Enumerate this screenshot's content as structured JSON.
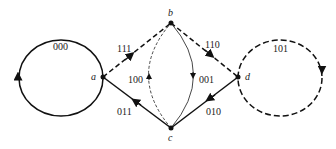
{
  "diagram": {
    "type": "state-transition-graph",
    "nodes": [
      {
        "id": "a",
        "label": "a"
      },
      {
        "id": "b",
        "label": "b"
      },
      {
        "id": "c",
        "label": "c"
      },
      {
        "id": "d",
        "label": "d"
      }
    ],
    "edges": [
      {
        "from": "a",
        "to": "a",
        "label": "000",
        "style": "solid"
      },
      {
        "from": "a",
        "to": "b",
        "label": "111",
        "style": "dashed"
      },
      {
        "from": "c",
        "to": "b",
        "label": "100",
        "style": "dashed"
      },
      {
        "from": "b",
        "to": "c",
        "label": "001",
        "style": "solid"
      },
      {
        "from": "b",
        "to": "d",
        "label": "110",
        "style": "dashed"
      },
      {
        "from": "c",
        "to": "a",
        "label": "011",
        "style": "solid"
      },
      {
        "from": "d",
        "to": "c",
        "label": "010",
        "style": "solid"
      },
      {
        "from": "d",
        "to": "d",
        "label": "101",
        "style": "dashed"
      }
    ]
  }
}
